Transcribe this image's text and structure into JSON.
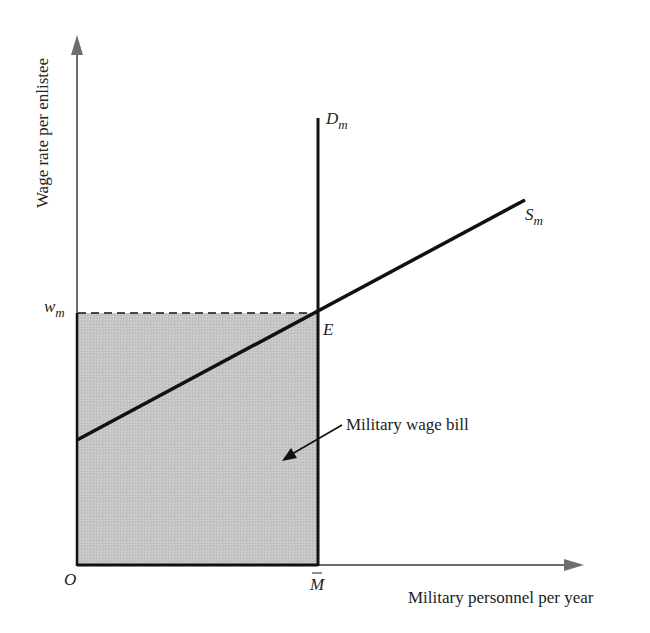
{
  "diagram": {
    "type": "economics-supply-demand",
    "y_axis": {
      "label": "Wage rate per enlistee"
    },
    "x_axis": {
      "label": "Military personnel per year"
    },
    "origin_label": "O",
    "price_label": {
      "base": "w",
      "sub": "m"
    },
    "quantity_label": {
      "base": "M",
      "overbar": true
    },
    "demand_curve": {
      "base": "D",
      "sub": "m",
      "shape": "vertical"
    },
    "supply_curve": {
      "base": "S",
      "sub": "m",
      "shape": "upward-sloping"
    },
    "equilibrium_label": "E",
    "shaded_area_label": "Military wage bill",
    "colors": {
      "axis": "#6e6e6e",
      "curve": "#111111",
      "shade": "#c4c4c4",
      "text": "#222222"
    }
  }
}
